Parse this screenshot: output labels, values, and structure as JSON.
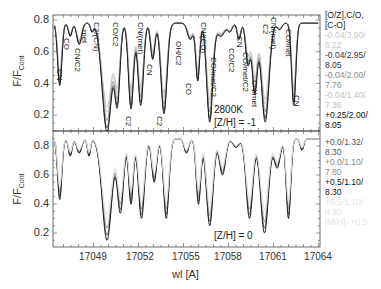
{
  "chart_data": {
    "type": "line",
    "xlabel": "wl [A]",
    "ylabel": "F/F_Cont",
    "x_ticks": [
      17049,
      17052,
      17055,
      17058,
      17061,
      17064
    ],
    "y_ticks": [
      0.2,
      0.4,
      0.6,
      0.8
    ],
    "xlim": [
      17046.3,
      17064.1
    ],
    "panels": [
      {
        "name": "top",
        "annotation_lines": [
          "2800K",
          "[Z/H] = -1"
        ],
        "ylim": [
          0.1,
          0.85
        ],
        "line_labels": [
          {
            "text": "CN",
            "wl": 17046.9,
            "y": 0.42
          },
          {
            "text": "CO",
            "wl": 17047.4,
            "y": 0.67
          },
          {
            "text": "CN/C2",
            "wl": 17048.3,
            "y": 0.6
          },
          {
            "text": "met",
            "wl": 17048.6,
            "y": 0.74
          },
          {
            "text": "C2/(CN)",
            "wl": 17049.3,
            "y": 0.75
          },
          {
            "text": "CO/C2",
            "wl": 17051.1,
            "y": 0.75
          },
          {
            "text": "C2",
            "wl": 17051.4,
            "y": 0.2
          },
          {
            "text": "CN/(met)",
            "wl": 17052.9,
            "y": 0.74
          },
          {
            "text": "CN",
            "wl": 17053.2,
            "y": 0.52
          },
          {
            "text": "C2",
            "wl": 17054.0,
            "y": 0.2
          },
          {
            "text": "OH/C2",
            "wl": 17055.0,
            "y": 0.66
          },
          {
            "text": "CO",
            "wl": 17055.6,
            "y": 0.43
          },
          {
            "text": "CN/(CO)",
            "wl": 17056.5,
            "y": 0.76
          },
          {
            "text": "CO/met/C2",
            "wl": 17057.1,
            "y": 0.6
          },
          {
            "text": "CO/C2",
            "wl": 17058.2,
            "y": 0.67
          },
          {
            "text": "CN",
            "wl": 17058.7,
            "y": 0.72
          },
          {
            "text": "CO/met/C2",
            "wl": 17059.1,
            "y": 0.6
          },
          {
            "text": "CN/met",
            "wl": 17059.6,
            "y": 0.47
          },
          {
            "text": "C2",
            "wl": 17060.2,
            "y": 0.75
          },
          {
            "text": "CN/(met)",
            "wl": 17060.7,
            "y": 0.76
          },
          {
            "text": "CO/met",
            "wl": 17061.6,
            "y": 0.76
          },
          {
            "text": "CN",
            "wl": 17062.2,
            "y": 0.3
          }
        ],
        "series": [
          {
            "name": "-0.04/3.90/8.22",
            "color": "#c8c8c8"
          },
          {
            "name": "-0.04/2.95/8.05",
            "color": "#333333"
          },
          {
            "name": "-0.04/2.00/7.76",
            "color": "#888888"
          },
          {
            "name": "-0.04/1.40/7.36",
            "color": "#bdbdbd"
          },
          {
            "name": "+0.25/2.00/8.05",
            "color": "#111111"
          }
        ]
      },
      {
        "name": "bottom",
        "annotation_lines": [
          "[Z/H] = 0"
        ],
        "ylim": [
          0.1,
          0.9
        ],
        "series": [
          {
            "name": "+0.0/1.32/8.30",
            "color": "#555555"
          },
          {
            "name": "+0.0/1.10/7.80",
            "color": "#888888"
          },
          {
            "name": "+0.5/1.10/8.30",
            "color": "#111111"
          },
          {
            "name": "+0.5/1.10/8.30 (faint)",
            "color": "#e0e0e0"
          },
          {
            "name": "[M/H]=+0.5",
            "color": "#e0e0e0"
          }
        ]
      }
    ]
  },
  "axes": {
    "ylabel_main": "F/F",
    "ylabel_sub": "Cont",
    "xlabel": "wl [A]",
    "top_yticks": [
      "0.8",
      "0.6",
      "0.4",
      "0.2"
    ],
    "bottom_yticks": [
      "0.8",
      "0.6",
      "0.4",
      "0.2"
    ],
    "xticks": [
      "17049",
      "17052",
      "17055",
      "17058",
      "17061",
      "17064"
    ]
  },
  "top_panel": {
    "note1": "2800K",
    "note2": "[Z/H] = -1",
    "labels": [
      "CN",
      "CO",
      "CN/C2",
      "met",
      "C2/(CN)",
      "CO/C2",
      "C2",
      "CN/(met)",
      "CN",
      "C2",
      "OH/C2",
      "CO",
      "CN/(CO)",
      "CO/met/C2",
      "CO/C2",
      "CN",
      "CO/met/C2",
      "CN/met",
      "C2",
      "CN/(met)",
      "CO/met",
      "CN"
    ]
  },
  "bottom_panel": {
    "note": "[Z/H] = 0"
  },
  "legend": {
    "title1": "[O/Z],C/O,",
    "title2": "[C-O]",
    "top": [
      {
        "l1": "-0.04/3.90/",
        "l2": "8.22",
        "color": "#c9c9c9"
      },
      {
        "l1": "-0.04/2.95/",
        "l2": "8.05",
        "color": "#333333"
      },
      {
        "l1": "-0.04/2.00/",
        "l2": "7.76",
        "color": "#8a8a8a"
      },
      {
        "l1": "-0.04/1.40/",
        "l2": "7.36",
        "color": "#c0c0c0"
      },
      {
        "l1": "+0.25/2.00/",
        "l2": "8.05",
        "color": "#111111"
      }
    ],
    "bottom": [
      {
        "l1": "+0.0/1.32/",
        "l2": "8.30",
        "color": "#555555"
      },
      {
        "l1": "+0.0/1.10/",
        "l2": "7.80",
        "color": "#8a8a8a"
      },
      {
        "l1": "+0.5/1.10/",
        "l2": "8.30",
        "color": "#111111"
      },
      {
        "l1": "+0.5/1.10/",
        "l2": "8.30",
        "color": "#e3e3e3"
      },
      {
        "l1": "[M/H]=+0.5",
        "l2": "",
        "color": "#e3e3e3"
      }
    ]
  }
}
